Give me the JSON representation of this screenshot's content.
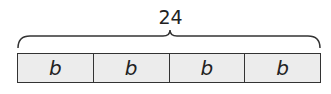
{
  "diagram": {
    "type": "tape-diagram",
    "total": "24",
    "segments": [
      {
        "label": "b"
      },
      {
        "label": "b"
      },
      {
        "label": "b"
      },
      {
        "label": "b"
      }
    ],
    "colors": {
      "segment_fill": "#ececec",
      "stroke": "#333333"
    }
  }
}
